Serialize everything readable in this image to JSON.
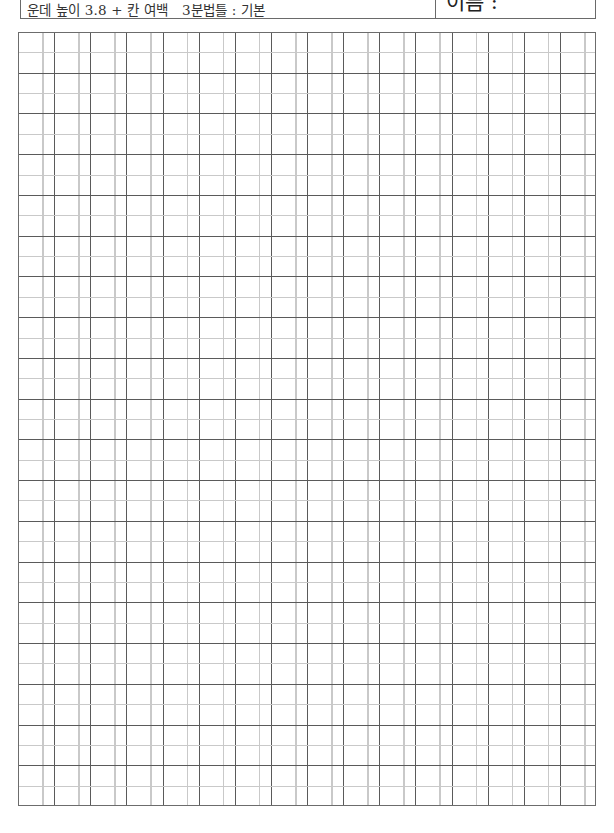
{
  "header": {
    "title": "운데 높이 3.8 + 칸 여백   3분법틀 : 기본",
    "name_label": "이름 :"
  },
  "grid": {
    "columns": 16,
    "rows": 19,
    "column_width_px": 36.1,
    "row_height_px": 40.7,
    "column_guide_offset_ratio": 0.667,
    "row_guide_offset_ratio": 0.5,
    "colors": {
      "major_line": "#5a5a5a",
      "guide_line": "#c9c9c9",
      "border": "#6c6c6c",
      "background": "#ffffff"
    }
  }
}
